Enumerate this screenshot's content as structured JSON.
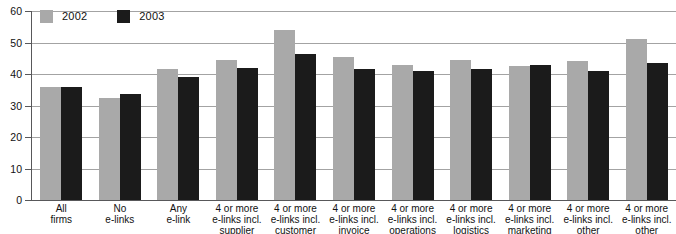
{
  "chart_data": {
    "type": "bar",
    "title": "",
    "xlabel": "",
    "ylabel": "",
    "ylim": [
      0,
      60
    ],
    "yticks": [
      0,
      10,
      20,
      30,
      40,
      50,
      60
    ],
    "grid": true,
    "legend_position": "top-left",
    "categories": [
      "All\nfirms",
      "No\ne-links",
      "Any\ne-link",
      "4 or more\ne-links incl.\nsupplier",
      "4 or more\ne-links incl.\ncustomer",
      "4 or more\ne-links incl.\ninvoice",
      "4 or more\ne-links incl.\noperations",
      "4 or more\ne-links incl.\nlogistics",
      "4 or more\ne-links incl.\nmarketing",
      "4 or more\ne-links incl.\nother internal",
      "4 or more\ne-links incl.\nother external"
    ],
    "series": [
      {
        "name": "2002",
        "color": "#a9a9a9",
        "values": [
          36,
          32.5,
          41.5,
          44.5,
          54,
          45.5,
          43,
          44.5,
          42.5,
          44,
          51
        ]
      },
      {
        "name": "2003",
        "color": "#1b1b1b",
        "values": [
          36,
          33.5,
          39,
          42,
          46.5,
          41.5,
          41,
          41.5,
          43,
          41,
          43.5
        ]
      }
    ]
  }
}
